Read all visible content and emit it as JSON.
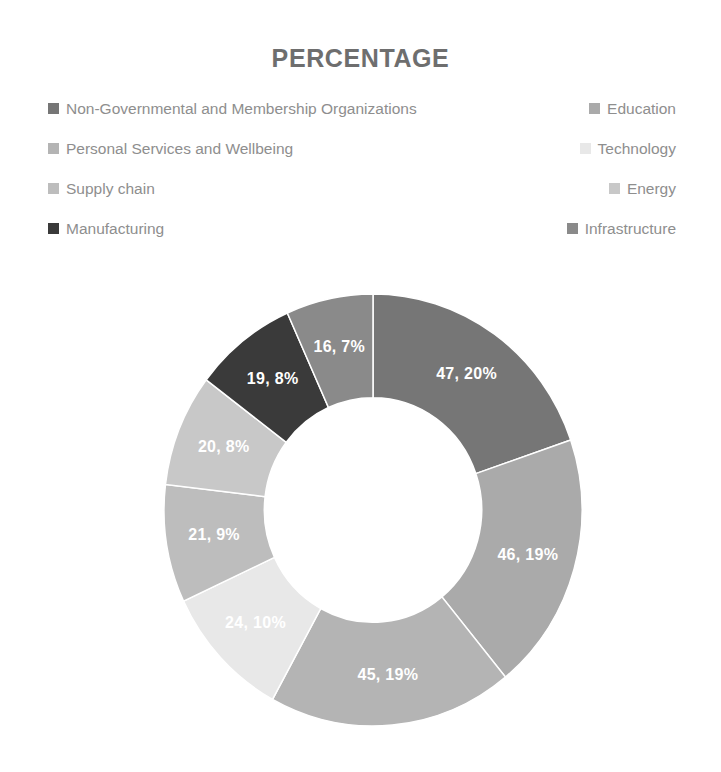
{
  "header": {
    "title": "PERCENTAGE"
  },
  "legend": {
    "rows": [
      {
        "left": {
          "label": "Non-Governmental and Membership Organizations",
          "color": "#767676"
        },
        "right": {
          "label": "Education",
          "color": "#aaaaaa"
        }
      },
      {
        "left": {
          "label": "Personal Services and Wellbeing",
          "color": "#b4b4b4"
        },
        "right": {
          "label": "Technology",
          "color": "#e8e8e8"
        }
      },
      {
        "left": {
          "label": "Supply chain",
          "color": "#bdbdbd"
        },
        "right": {
          "label": "Energy",
          "color": "#c8c8c8"
        }
      },
      {
        "left": {
          "label": "Manufacturing",
          "color": "#3a3a3a"
        },
        "right": {
          "label": "Infrastructure",
          "color": "#8a8a8a"
        }
      }
    ]
  },
  "chart_data": {
    "type": "pie",
    "variant": "donut",
    "title": "PERCENTAGE",
    "xlabel": "",
    "ylabel": "",
    "legend_position": "top",
    "grid": false,
    "hole_ratio": 0.52,
    "start_angle_deg": 0,
    "direction": "clockwise",
    "total": 238,
    "categories": [
      "Non-Governmental and Membership Organizations",
      "Education",
      "Personal Services and Wellbeing",
      "Technology",
      "Supply chain",
      "Energy",
      "Manufacturing",
      "Infrastructure"
    ],
    "values": [
      47,
      46,
      45,
      24,
      21,
      20,
      19,
      16
    ],
    "percentages": [
      20,
      19,
      19,
      10,
      9,
      8,
      8,
      7
    ],
    "colors": [
      "#767676",
      "#aaaaaa",
      "#b4b4b4",
      "#e8e8e8",
      "#bdbdbd",
      "#c8c8c8",
      "#3a3a3a",
      "#8a8a8a"
    ],
    "data_labels": [
      "47, 20%",
      "46, 19%",
      "45, 19%",
      "24, 10%",
      "21, 9%",
      "20, 8%",
      "19, 8%",
      "16, 7%"
    ],
    "slices": [
      {
        "category": "Non-Governmental and Membership Organizations",
        "value": 47,
        "percent": 20,
        "label": "47, 20%",
        "color": "#767676"
      },
      {
        "category": "Education",
        "value": 46,
        "percent": 19,
        "label": "46, 19%",
        "color": "#aaaaaa"
      },
      {
        "category": "Personal Services and Wellbeing",
        "value": 45,
        "percent": 19,
        "label": "45, 19%",
        "color": "#b4b4b4"
      },
      {
        "category": "Technology",
        "value": 24,
        "percent": 10,
        "label": "24, 10%",
        "color": "#e8e8e8"
      },
      {
        "category": "Supply chain",
        "value": 21,
        "percent": 9,
        "label": "21, 9%",
        "color": "#bdbdbd"
      },
      {
        "category": "Energy",
        "value": 20,
        "percent": 8,
        "label": "20, 8%",
        "color": "#c8c8c8"
      },
      {
        "category": "Manufacturing",
        "value": 19,
        "percent": 8,
        "label": "19, 8%",
        "color": "#3a3a3a"
      },
      {
        "category": "Infrastructure",
        "value": 16,
        "percent": 7,
        "label": "16, 7%",
        "color": "#8a8a8a"
      }
    ]
  }
}
